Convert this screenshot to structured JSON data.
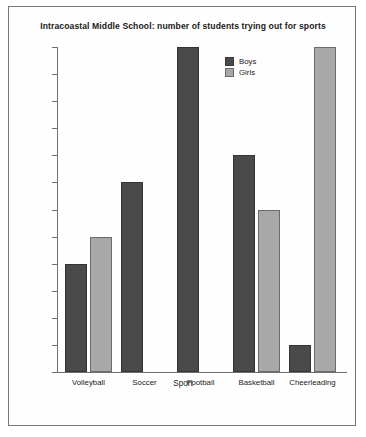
{
  "chart_data": {
    "type": "bar",
    "title": "Intracoastal Middle School: number of students trying out for sports",
    "xlabel": "Sport",
    "ylabel": "",
    "categories": [
      "Volleyball",
      "Soccer",
      "Football",
      "Basketball",
      "Cheerleading"
    ],
    "series": [
      {
        "name": "Boys",
        "color": "#4a4a4a",
        "values": [
          20,
          35,
          60,
          40,
          5
        ]
      },
      {
        "name": "Girls",
        "color": "#a8a8a8",
        "values": [
          25,
          null,
          null,
          30,
          60
        ]
      }
    ],
    "ylim": [
      0,
      60
    ],
    "ytick_step": 5,
    "yticks": [
      0,
      5,
      10,
      15,
      20,
      25,
      30,
      35,
      40,
      45,
      50,
      55,
      60
    ],
    "ytick_labels": [
      "0",
      "5",
      "10",
      "15",
      "20",
      "25",
      "30",
      "35",
      "40",
      "45",
      "50",
      "55",
      "60"
    ],
    "grid": false,
    "legend_position": "top-center-right",
    "legend": [
      "Boys",
      "Girls"
    ]
  }
}
